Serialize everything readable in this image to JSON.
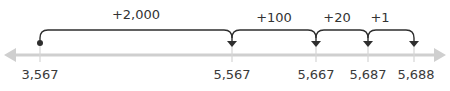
{
  "number_line": {
    "start": "3,567",
    "ticks": [
      {
        "label": "3,567",
        "x": 40
      },
      {
        "label": "5,567",
        "x": 232
      },
      {
        "label": "5,667",
        "x": 316
      },
      {
        "label": "5,687",
        "x": 368
      },
      {
        "label": "5,688",
        "x": 414
      }
    ],
    "jumps": [
      {
        "label": "+2,000",
        "from": 40,
        "to": 232
      },
      {
        "label": "+100",
        "from": 232,
        "to": 316
      },
      {
        "label": "+20",
        "from": 316,
        "to": 368
      },
      {
        "label": "+1",
        "from": 368,
        "to": 414
      }
    ]
  },
  "colors": {
    "axis": "#c8c8c8",
    "arc": "#2e2e2e",
    "text": "#3a3a3a"
  }
}
